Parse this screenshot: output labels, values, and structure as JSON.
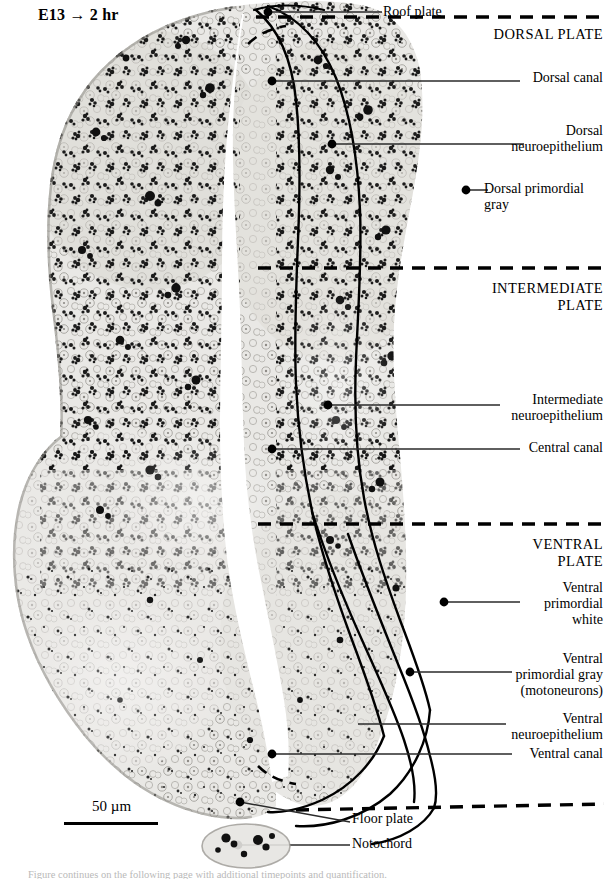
{
  "figure": {
    "title": "E13 → 2 hr",
    "scale_bar": {
      "label": "50 µm"
    },
    "caption_fragment": "Figure continues on the following page with additional timepoints and quantification."
  },
  "plate_divisions": [
    {
      "name": "dorsal-plate",
      "label": "DORSAL PLATE"
    },
    {
      "name": "intermediate-plate",
      "label": "INTERMEDIATE\nPLATE"
    },
    {
      "name": "ventral-plate",
      "label": "VENTRAL\nPLATE"
    }
  ],
  "annotations": [
    {
      "name": "roof-plate",
      "label": "Roof plate"
    },
    {
      "name": "dorsal-canal",
      "label": "Dorsal canal"
    },
    {
      "name": "dorsal-neuroepithelium",
      "label": "Dorsal\nneuroepithelium"
    },
    {
      "name": "dorsal-primordial-gray",
      "label": "Dorsal primordial\ngray"
    },
    {
      "name": "intermediate-neuroepithelium",
      "label": "Intermediate\nneuroepithelium"
    },
    {
      "name": "central-canal",
      "label": "Central canal"
    },
    {
      "name": "ventral-primordial-white",
      "label": "Ventral\nprimordial\nwhite"
    },
    {
      "name": "ventral-primordial-gray",
      "label": "Ventral\nprimordial gray\n(motoneurons)"
    },
    {
      "name": "ventral-neuroepithelium",
      "label": "Ventral\nneuroepithelium"
    },
    {
      "name": "ventral-canal",
      "label": "Ventral canal"
    },
    {
      "name": "floor-plate",
      "label": "Floor plate"
    },
    {
      "name": "notochord",
      "label": "Notochord"
    }
  ],
  "colors": {
    "ink": "#000000",
    "leader_line": "#2a2a2a",
    "tissue_light": "#e8e7e4",
    "tissue_mid": "#cfcdc8",
    "tissue_dark": "#1a1a1a",
    "background": "#ffffff"
  }
}
